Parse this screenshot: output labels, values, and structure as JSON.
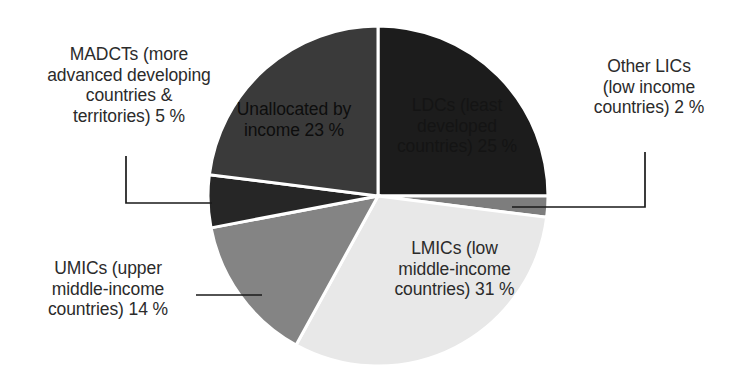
{
  "chart_data": {
    "type": "pie",
    "title": "",
    "subtitle": "",
    "xlabel": "",
    "ylabel": "",
    "grid": false,
    "legend_position": "none",
    "unit": "%",
    "start_angle_deg": 0,
    "direction": "clockwise",
    "categories": [
      "LDCs (least developed countries)",
      "Other LICs (low income countries)",
      "LMICs (low middle-income countries)",
      "UMICs (upper middle-income countries)",
      "MADCTs (more advanced developing countries & territories)",
      "Unallocated by income"
    ],
    "values": [
      25,
      2,
      31,
      14,
      5,
      23
    ],
    "colors": [
      "#1c1c1c",
      "#7d7d7d",
      "#e8e8e8",
      "#848484",
      "#262626",
      "#3a3a3a"
    ],
    "slices": [
      {
        "key": "ldcs",
        "label": "LDCs (least\ndeveloped\ncountries) 25 %",
        "name": "LDCs (least developed countries)",
        "value": 25,
        "color": "#1c1c1c",
        "label_placement": "inside",
        "text_tone": "dark"
      },
      {
        "key": "other-lics",
        "label": "Other LICs\n(low income\ncountries) 2 %",
        "name": "Other LICs (low income countries)",
        "value": 2,
        "color": "#7d7d7d",
        "label_placement": "callout-right",
        "text_tone": "dark"
      },
      {
        "key": "lmics",
        "label": "LMICs (low\nmiddle-income\ncountries) 31 %",
        "name": "LMICs (low middle-income countries)",
        "value": 31,
        "color": "#e8e8e8",
        "label_placement": "inside",
        "text_tone": "dark"
      },
      {
        "key": "umics",
        "label": "UMICs (upper\nmiddle-income\ncountries) 14 %",
        "name": "UMICs (upper middle-income countries)",
        "value": 14,
        "color": "#848484",
        "label_placement": "callout-left",
        "text_tone": "dark"
      },
      {
        "key": "madcts",
        "label": "MADCTs (more\nadvanced developing\ncountries &\nterritories) 5 %",
        "name": "MADCTs (more advanced developing countries & territories)",
        "value": 5,
        "color": "#262626",
        "label_placement": "callout-left",
        "text_tone": "dark"
      },
      {
        "key": "unallocated",
        "label": "Unallocated by\nincome 23 %",
        "name": "Unallocated by income",
        "value": 23,
        "color": "#3a3a3a",
        "label_placement": "inside",
        "text_tone": "dark"
      }
    ]
  },
  "figure": {
    "background": "#ffffff",
    "separator_color": "#ffffff",
    "leader_line_color": "#1a1a1a",
    "text_color": "#2b2b2b"
  }
}
